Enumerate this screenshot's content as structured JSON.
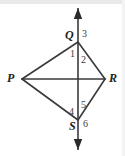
{
  "figure": {
    "kind": "geometry-diagram",
    "background_color": "#ffffff",
    "stroke_color": "#3a3a3a",
    "top_band_color": "#e9e9e9",
    "canvas": {
      "width": 125,
      "height": 156
    }
  },
  "vertices": [
    {
      "id": "P",
      "label": "P",
      "x": 22,
      "y": 79,
      "label_x": 7,
      "label_y": 72
    },
    {
      "id": "Q",
      "label": "Q",
      "x": 78,
      "y": 42,
      "label_x": 65,
      "label_y": 29
    },
    {
      "id": "R",
      "label": "R",
      "x": 105,
      "y": 79,
      "label_x": 109,
      "label_y": 72
    },
    {
      "id": "S",
      "label": "S",
      "x": 78,
      "y": 120,
      "label_x": 69,
      "label_y": 120
    }
  ],
  "angle_labels": [
    {
      "id": "angle-1",
      "label": "1",
      "x": 70,
      "y": 49
    },
    {
      "id": "angle-2",
      "label": "2",
      "x": 81,
      "y": 55
    },
    {
      "id": "angle-3",
      "label": "3",
      "x": 82,
      "y": 29
    },
    {
      "id": "angle-4",
      "label": "4",
      "x": 69,
      "y": 107
    },
    {
      "id": "angle-5",
      "label": "5",
      "x": 81,
      "y": 100
    },
    {
      "id": "angle-6",
      "label": "6",
      "x": 83,
      "y": 119
    }
  ],
  "segments": [
    {
      "id": "PQ",
      "x1": 22,
      "y1": 79,
      "x2": 78,
      "y2": 42
    },
    {
      "id": "QR",
      "x1": 78,
      "y1": 42,
      "x2": 105,
      "y2": 79
    },
    {
      "id": "RS",
      "x1": 105,
      "y1": 79,
      "x2": 78,
      "y2": 120
    },
    {
      "id": "SP",
      "x1": 78,
      "y1": 120,
      "x2": 22,
      "y2": 79
    },
    {
      "id": "PR",
      "x1": 22,
      "y1": 79,
      "x2": 105,
      "y2": 79
    }
  ],
  "vertical_line": {
    "id": "QS-line",
    "x": 78,
    "y_top": 8,
    "y_bottom": 150,
    "arrow_top": true,
    "arrow_bottom": true
  }
}
